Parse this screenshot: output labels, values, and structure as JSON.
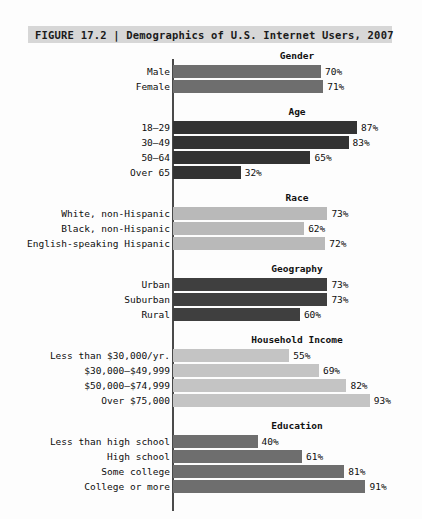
{
  "figure": {
    "title": "FIGURE 17.2 | Demographics of U.S. Internet Users, 2007",
    "title_bar_color": "#d7d7d7"
  },
  "chart_data": {
    "type": "bar",
    "title": "FIGURE 17.2 | Demographics of U.S. Internet Users, 2007",
    "xlabel": "",
    "ylabel": "",
    "xlim": [
      0,
      100
    ],
    "orientation": "horizontal",
    "grid": false,
    "legend": "none",
    "value_suffix": "%",
    "groups": [
      {
        "name": "Gender",
        "color": "#6e6e6e",
        "categories": [
          "Male",
          "Female"
        ],
        "values": [
          70,
          71
        ],
        "labels": [
          "70%",
          "71%"
        ]
      },
      {
        "name": "Age",
        "color": "#333333",
        "categories": [
          "18–29",
          "30–49",
          "50–64",
          "Over 65"
        ],
        "values": [
          87,
          83,
          65,
          32
        ],
        "labels": [
          "87%",
          "83%",
          "65%",
          "32%"
        ]
      },
      {
        "name": "Race",
        "color": "#b9b9b9",
        "categories": [
          "White, non-Hispanic",
          "Black, non-Hispanic",
          "English-speaking Hispanic"
        ],
        "values": [
          73,
          62,
          72
        ],
        "labels": [
          "73%",
          "62%",
          "72%"
        ]
      },
      {
        "name": "Geography",
        "color": "#3f3f3f",
        "categories": [
          "Urban",
          "Suburban",
          "Rural"
        ],
        "values": [
          73,
          73,
          60
        ],
        "labels": [
          "73%",
          "73%",
          "60%"
        ]
      },
      {
        "name": "Household Income",
        "color": "#c4c4c4",
        "categories": [
          "Less than $30,000/yr.",
          "$30,000–$49,999",
          "$50,000–$74,999",
          "Over $75,000"
        ],
        "values": [
          55,
          69,
          82,
          93
        ],
        "labels": [
          "55%",
          "69%",
          "82%",
          "93%"
        ]
      },
      {
        "name": "Education",
        "color": "#6e6e6e",
        "categories": [
          "Less than high school",
          "High school",
          "Some college",
          "College or more"
        ],
        "values": [
          40,
          61,
          81,
          91
        ],
        "labels": [
          "40%",
          "61%",
          "81%",
          "91%"
        ]
      }
    ]
  }
}
